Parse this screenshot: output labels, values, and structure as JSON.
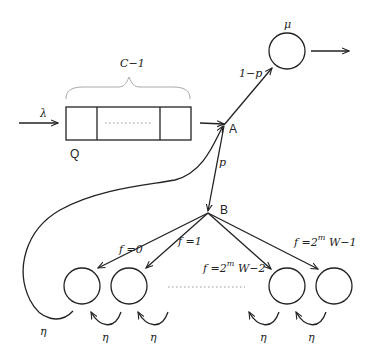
{
  "diagram": {
    "type": "queueing-network",
    "nodes": {
      "queue": {
        "label": "Q",
        "capacity_label": "C−1"
      },
      "junction_a": {
        "label": "A"
      },
      "junction_b": {
        "label": "B"
      },
      "server": {
        "rate_label": "μ"
      },
      "backoff_stages": [
        {
          "branch_label": "f =0",
          "rate_label": "η"
        },
        {
          "branch_label": "f =1",
          "rate_label": "η"
        },
        {
          "branch_label": "f =2",
          "superscript": "m",
          "suffix": " W−2",
          "rate_label": "η"
        },
        {
          "branch_label": "f =2",
          "superscript": "m",
          "suffix": " W−1",
          "rate_label": "η"
        }
      ],
      "feedback_rate_label": "η"
    },
    "edges": {
      "arrival_label": "λ",
      "a_to_server_label": "1−p",
      "a_to_b_label": "p"
    }
  }
}
